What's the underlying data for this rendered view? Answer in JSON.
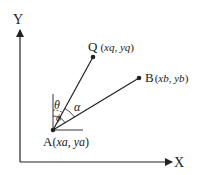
{
  "axes": {
    "x_label": "X",
    "y_label": "Y"
  },
  "points": {
    "A": {
      "name": "A",
      "coords": "(xa, ya)",
      "x_sym": "xa",
      "y_sym": "ya"
    },
    "Q": {
      "name": "Q",
      "coords": "(xq, yq)",
      "x_sym": "xq",
      "y_sym": "yq"
    },
    "B": {
      "name": "B",
      "coords": "(xb, yb)",
      "x_sym": "xb",
      "y_sym": "yb"
    }
  },
  "angles": {
    "theta": "θ",
    "phi": "ϕ",
    "alpha": "α"
  },
  "colors": {
    "line": "#222222",
    "background": "#ffffff"
  }
}
